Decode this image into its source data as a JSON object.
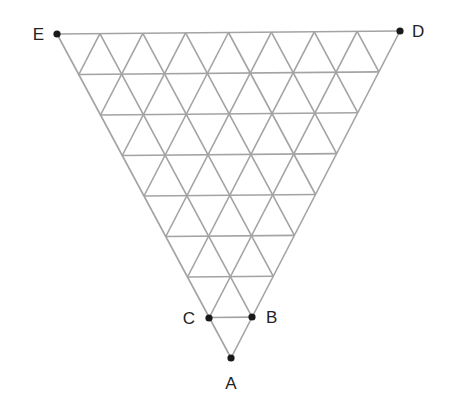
{
  "diagram": {
    "type": "triangular-grid",
    "subdivisions": 8,
    "colors": {
      "grid": "#a3a3a3",
      "points": "#1a1a1a",
      "labels": "#222222"
    },
    "outer_vertices": {
      "top_left": {
        "x": 57,
        "y": 34
      },
      "top_right": {
        "x": 400,
        "y": 31
      },
      "bottom": {
        "x": 231,
        "y": 358
      }
    },
    "points": [
      {
        "id": "A",
        "label": "A",
        "x": 231,
        "y": 358,
        "label_x": 231,
        "label_y": 389,
        "anchor": "middle"
      },
      {
        "id": "B",
        "label": "B",
        "x": 252,
        "y": 317,
        "label_x": 266,
        "label_y": 323,
        "anchor": "start"
      },
      {
        "id": "C",
        "label": "C",
        "x": 209,
        "y": 318,
        "label_x": 195,
        "label_y": 324,
        "anchor": "end"
      },
      {
        "id": "D",
        "label": "D",
        "x": 400,
        "y": 31,
        "label_x": 412,
        "label_y": 37,
        "anchor": "start"
      },
      {
        "id": "E",
        "label": "E",
        "x": 57,
        "y": 34,
        "label_x": 44,
        "label_y": 40,
        "anchor": "end"
      }
    ],
    "highlighted_segment": [
      "C",
      "B"
    ]
  }
}
